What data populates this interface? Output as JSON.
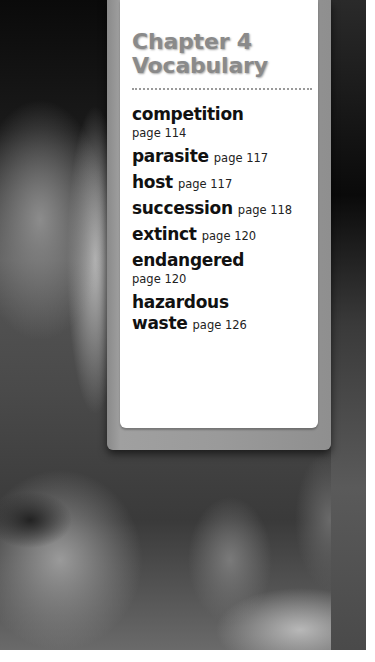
{
  "card": {
    "title_line1": "Chapter 4",
    "title_line2": "Vocabulary"
  },
  "vocabulary": [
    {
      "term": "competition",
      "page": "page 114"
    },
    {
      "term": "parasite",
      "page": "page 117"
    },
    {
      "term": "host",
      "page": "page 117"
    },
    {
      "term": "succession",
      "page": "page 118"
    },
    {
      "term": "extinct",
      "page": "page 120"
    },
    {
      "term": "endangered",
      "page": "page 120"
    },
    {
      "term_line1": "hazardous",
      "term_line2": "waste",
      "page": "page 126"
    }
  ],
  "colors": {
    "title": "#8a8a8a",
    "panel": "#ffffff",
    "frame": "#9a9a9a"
  }
}
